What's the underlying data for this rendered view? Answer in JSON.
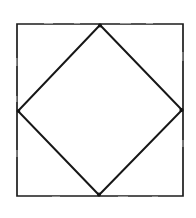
{
  "figure": {
    "background_color": "#ffffff",
    "stroke_color": "#1a1a1a",
    "canvas": {
      "width": 196,
      "height": 218
    },
    "outer_square": {
      "name": "outer-square",
      "stroke_width": 1.7,
      "points": "17,24 183,24 183,196 17,196",
      "corners": [
        {
          "label": "top-left",
          "x": 17,
          "y": 24
        },
        {
          "label": "top-right",
          "x": 183,
          "y": 24
        },
        {
          "label": "bottom-right",
          "x": 183,
          "y": 196
        },
        {
          "label": "bottom-left",
          "x": 17,
          "y": 196
        }
      ]
    },
    "inner_diamond": {
      "name": "inscribed-rotated-square",
      "stroke_width": 2.0,
      "points": "100,25 182,110 99,195 18,111",
      "vertices": [
        {
          "label": "top",
          "x": 100,
          "y": 25
        },
        {
          "label": "right",
          "x": 182,
          "y": 110
        },
        {
          "label": "bottom",
          "x": 99,
          "y": 195
        },
        {
          "label": "left",
          "x": 18,
          "y": 111
        }
      ]
    },
    "vertex_blots": [
      {
        "name": "top-vertex-blot",
        "cx": 100,
        "cy": 25.5,
        "r": 1.9
      },
      {
        "name": "right-vertex-blot",
        "cx": 181.5,
        "cy": 110,
        "r": 2.1
      },
      {
        "name": "bottom-vertex-blot",
        "cx": 99,
        "cy": 194.5,
        "r": 2.0
      },
      {
        "name": "left-vertex-blot",
        "cx": 18.5,
        "cy": 111,
        "r": 1.8
      }
    ],
    "scan_speckles": [
      {
        "x": 44,
        "y": 22.6,
        "width": 9,
        "height": 1.2
      },
      {
        "x": 74,
        "y": 22.6,
        "width": 6,
        "height": 1.1
      },
      {
        "x": 120,
        "y": 22.7,
        "width": 11,
        "height": 1.0
      },
      {
        "x": 146,
        "y": 22.6,
        "width": 7,
        "height": 1.2
      },
      {
        "x": 16.3,
        "y": 58,
        "width": 1.1,
        "height": 8
      },
      {
        "x": 16.3,
        "y": 96,
        "width": 1.0,
        "height": 6
      },
      {
        "x": 16.4,
        "y": 150,
        "width": 1.1,
        "height": 7
      },
      {
        "x": 182.4,
        "y": 52,
        "width": 1.0,
        "height": 9
      },
      {
        "x": 182.4,
        "y": 140,
        "width": 1.1,
        "height": 7
      },
      {
        "x": 52,
        "y": 196.4,
        "width": 8,
        "height": 1.1
      },
      {
        "x": 118,
        "y": 196.3,
        "width": 10,
        "height": 1.2
      },
      {
        "x": 152,
        "y": 196.4,
        "width": 6,
        "height": 1.0
      }
    ]
  }
}
